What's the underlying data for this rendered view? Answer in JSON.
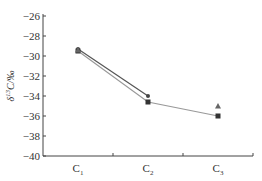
{
  "chart_data": {
    "type": "line",
    "title": "",
    "xlabel": "",
    "ylabel": "δ13C/‰",
    "categories": [
      "C1",
      "C2",
      "C3"
    ],
    "category_display": [
      {
        "base": "C",
        "sub": "1"
      },
      {
        "base": "C",
        "sub": "2"
      },
      {
        "base": "C",
        "sub": "3"
      }
    ],
    "ylim": [
      -40,
      -26
    ],
    "yticks": [
      -26,
      -28,
      -30,
      -32,
      -34,
      -36,
      -38,
      -40
    ],
    "ytick_labels": [
      "−26",
      "−28",
      "−30",
      "−32",
      "−34",
      "−36",
      "−38",
      "−40"
    ],
    "grid": false,
    "legend": null,
    "series": [
      {
        "name": "series-circle",
        "marker": "circle",
        "color": "#444444",
        "line_color": "#555555",
        "values": [
          -29.3,
          -34.0,
          null
        ],
        "connect": true
      },
      {
        "name": "series-square",
        "marker": "square",
        "color": "#333333",
        "line_color": "#999999",
        "values": [
          -29.5,
          -34.6,
          -36.0
        ],
        "connect": true
      },
      {
        "name": "series-triangle",
        "marker": "triangle",
        "color": "#666666",
        "line_color": null,
        "values": [
          -29.4,
          null,
          -35.0
        ],
        "connect": false
      }
    ]
  },
  "axis": {
    "ylabel_prefix": "δ",
    "ylabel_sup": "13",
    "ylabel_rest": "C/‰"
  }
}
